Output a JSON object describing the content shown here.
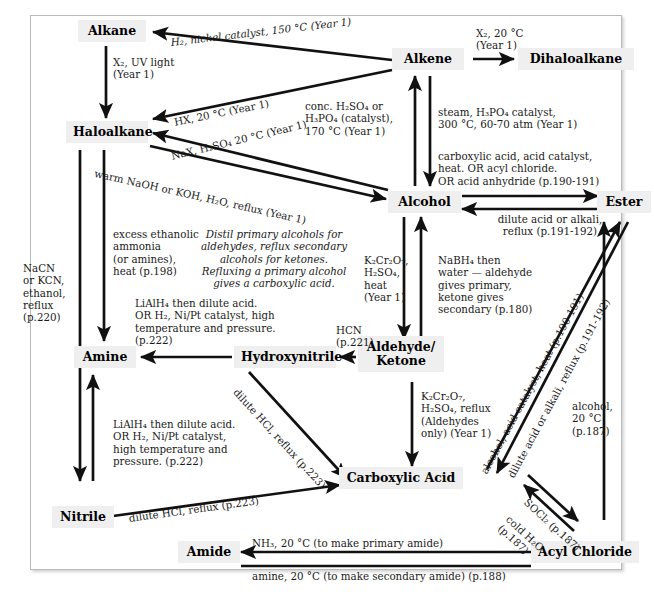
{
  "diagram": {
    "box_fill": "#efefef",
    "border_color": "#b9b9b9",
    "nodes": [
      {
        "id": "alkane",
        "label": "Alkane"
      },
      {
        "id": "alkene",
        "label": "Alkene"
      },
      {
        "id": "dihaloalkane",
        "label": "Dihaloalkane"
      },
      {
        "id": "haloalkane",
        "label": "Haloalkane"
      },
      {
        "id": "alcohol",
        "label": "Alcohol"
      },
      {
        "id": "ester",
        "label": "Ester"
      },
      {
        "id": "amine",
        "label": "Amine"
      },
      {
        "id": "hydroxynitrile",
        "label": "Hydroxynitrile"
      },
      {
        "id": "aldehyde_ketone",
        "label": "Aldehyde/\nKetone"
      },
      {
        "id": "carboxylic_acid",
        "label": "Carboxylic Acid"
      },
      {
        "id": "nitrile",
        "label": "Nitrile"
      },
      {
        "id": "amide",
        "label": "Amide"
      },
      {
        "id": "acyl_chloride",
        "label": "Acyl Chloride"
      }
    ],
    "labels": {
      "alkene_to_alkane": "H₂, nickel catalyst, 150 °C (Year 1)",
      "alkane_to_haloalkane": "X₂, UV light\n(Year 1)",
      "alkene_to_haloalkane_hx": "HX, 20 °C (Year 1)",
      "alkene_to_dihaloalkane": "X₂, 20 °C\n(Year 1)",
      "haloalkane_to_alkene": "conc. H₂SO₄ or\nH₃PO₄ (catalyst),\n170 °C (Year 1)",
      "alcohol_to_haloalkane": "NaX, H₂SO₄ 20 °C (Year 1)",
      "haloalkane_to_alcohol": "warm NaOH or KOH, H₂O, reflux (Year 1)",
      "alkene_to_alcohol": "steam, H₃PO₄ catalyst,\n300 °C, 60-70 atm (Year 1)",
      "alcohol_to_ester": "carboxylic acid, acid catalyst,\nheat.  OR acyl chloride.\nOR acid anhydride (p.190-191)",
      "ester_to_alcohol": "dilute acid or alkali,\nreflux (p.191-192)",
      "haloalkane_to_amine": "excess ethanolic\nammonia\n(or amines),\nheat (p.198)",
      "haloalkane_to_nitrile": "NaCN\nor KCN,\nethanol,\nreflux\n(p.220)",
      "distil_note": "Distil primary alcohols for\naldehydes, reflux secondary\nalcohols for ketones.\nRefluxing a primary alcohol\ngives a carboxylic acid.",
      "alcohol_to_aldehyde": "K₂Cr₂O₇,\nH₂SO₄,\nheat\n(Year 1)",
      "aldehyde_to_alcohol": "NaBH₄ then\nwater — aldehyde\ngives primary,\nketone gives\nsecondary (p.180)",
      "nitrile_to_amine": "LiAlH₄ then dilute acid.\nOR H₂, Ni/Pt catalyst,\nhigh temperature and\npressure. (p.222)",
      "hydroxynitrile_to_amine": "LiAlH₄ then dilute acid.\nOR H₂, Ni/Pt catalyst, high\ntemperature and pressure.\n(p.222)",
      "aldehyde_to_hydroxynitrile": "HCN\n(p.221)",
      "hydroxynitrile_to_acid": "dilute HCl, reflux (p.223)",
      "nitrile_to_acid": "dilute HCl, reflux (p.223)",
      "aldehyde_to_acid": "K₂Cr₂O₇,\nH₂SO₄, reflux\n(Aldehydes\nonly) (Year 1)",
      "acid_to_ester": "alcohol, acid catalyst, heat (p.190-191)",
      "ester_to_acid": "dilute acid or alkali, reflux (p.191-192)",
      "acyl_chloride_to_ester": "alcohol,\n20 °C\n(p.187)",
      "acid_to_acyl_chloride": "SOCl₂ (p.187)",
      "acyl_chloride_to_acid": "cold H₂O\n(p.187)",
      "acyl_to_amide_primary": "NH₃, 20 °C (to make primary amide)",
      "acyl_to_amide_secondary": "amine, 20 °C (to make secondary amide) (p.188)"
    }
  }
}
